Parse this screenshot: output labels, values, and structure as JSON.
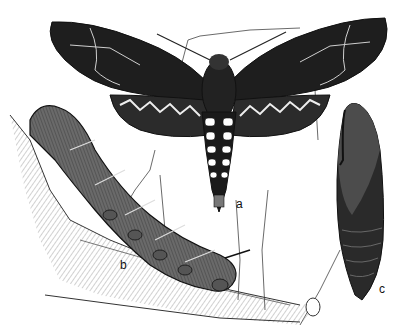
{
  "figure": {
    "labels": {
      "a": "a",
      "b": "b",
      "c": "c"
    },
    "colors": {
      "ink": "#1a1a1a",
      "paper": "#ffffff",
      "mid": "#555555",
      "light": "#9a9a9a"
    }
  }
}
